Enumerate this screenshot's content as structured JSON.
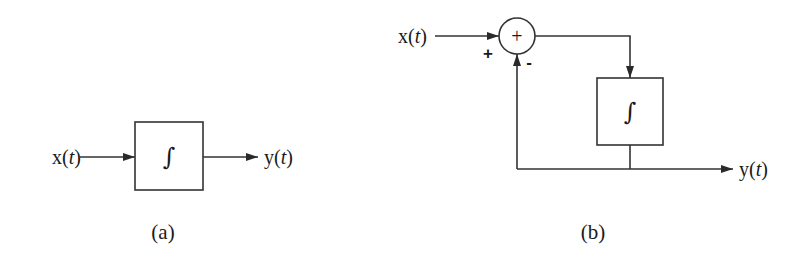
{
  "colors": {
    "stroke": "#333333",
    "text": "#1a1a1a",
    "background": "#ffffff"
  },
  "diagram_a": {
    "caption": "(a)",
    "input": {
      "var": "x",
      "open": "(",
      "arg": "t",
      "close": ")"
    },
    "output": {
      "var": "y",
      "open": "(",
      "arg": "t",
      "close": ")"
    },
    "block": {
      "symbol": "∫",
      "kind": "integrator"
    }
  },
  "diagram_b": {
    "caption": "(b)",
    "input": {
      "var": "x",
      "open": "(",
      "arg": "t",
      "close": ")"
    },
    "output": {
      "var": "y",
      "open": "(",
      "arg": "t",
      "close": ")"
    },
    "summer": {
      "symbol": "+",
      "plus_sign": "+",
      "minus_sign": "-"
    },
    "block": {
      "symbol": "∫",
      "kind": "integrator"
    }
  }
}
